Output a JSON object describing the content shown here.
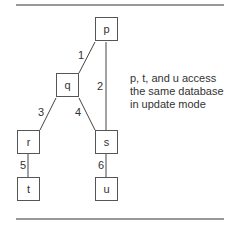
{
  "diagram": {
    "nodes": [
      {
        "id": "p",
        "label": "p"
      },
      {
        "id": "q",
        "label": "q"
      },
      {
        "id": "r",
        "label": "r"
      },
      {
        "id": "s",
        "label": "s"
      },
      {
        "id": "t",
        "label": "t"
      },
      {
        "id": "u",
        "label": "u"
      }
    ],
    "edges": [
      {
        "from": "p",
        "to": "q",
        "label": "1"
      },
      {
        "from": "p",
        "to": "s",
        "label": "2"
      },
      {
        "from": "q",
        "to": "r",
        "label": "3"
      },
      {
        "from": "q",
        "to": "s",
        "label": "4"
      },
      {
        "from": "r",
        "to": "t",
        "label": "5"
      },
      {
        "from": "s",
        "to": "u",
        "label": "6"
      }
    ],
    "note": {
      "line1": "p, t, and u access",
      "line2": "the same database",
      "line3": "in update mode"
    }
  }
}
